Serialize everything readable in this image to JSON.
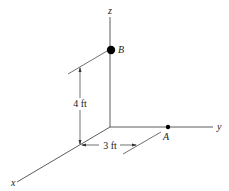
{
  "diagram": {
    "axes": {
      "x_label": "x",
      "y_label": "y",
      "z_label": "z"
    },
    "points": {
      "A": {
        "label": "A"
      },
      "B": {
        "label": "B"
      }
    },
    "dimensions": {
      "vertical": "4 ft",
      "horizontal": "3 ft"
    },
    "colors": {
      "line": "#333333",
      "point": "#000000",
      "background": "#ffffff"
    }
  }
}
